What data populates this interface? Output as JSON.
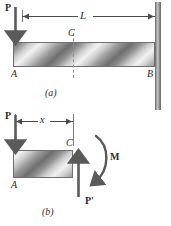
{
  "figure": {
    "colors": {
      "ink": "#2b2b2b",
      "line": "#4a4a4a",
      "beam_light": "#f2f2f2",
      "beam_dark": "#6e6e6e",
      "wall": "#9b9b9b",
      "dashed": "#8d8d8d"
    }
  },
  "panel_a": {
    "caption": "(a)",
    "load_label": "P",
    "dimension_label": "L",
    "point_left_label": "A",
    "point_right_label": "B",
    "section_label": "C",
    "load_icon": "down-arrow-icon",
    "support_icon": "fixed-wall-icon",
    "cut_icon": "dashed-section-line-icon"
  },
  "panel_b": {
    "caption": "(b)",
    "load_label": "P",
    "reaction_label": "P'",
    "moment_label": "M",
    "dimension_label": "x",
    "point_left_label": "A",
    "section_label": "C",
    "load_icon": "down-arrow-icon",
    "reaction_icon": "up-arrow-icon",
    "moment_icon": "clockwise-moment-arc-icon"
  }
}
